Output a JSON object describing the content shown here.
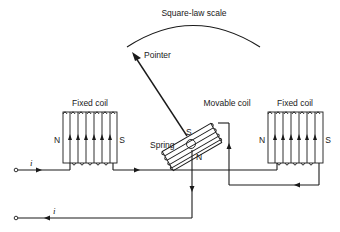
{
  "diagram": {
    "scale_label": "Square-law scale",
    "pointer_label": "Pointer",
    "left_coil": {
      "label": "Fixed coil",
      "north": "N",
      "south": "S"
    },
    "right_coil": {
      "label": "Fixed coil",
      "north": "N",
      "south": "S"
    },
    "movable_coil": {
      "label": "Movable coil",
      "north": "N",
      "south": "S"
    },
    "spring_label": "Spring",
    "current_in_label": "i",
    "current_out_label": "i",
    "colors": {
      "line": "#1a1a1a",
      "background": "#ffffff"
    }
  }
}
